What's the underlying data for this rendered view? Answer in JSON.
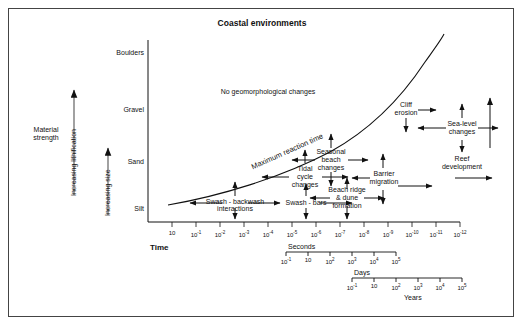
{
  "chart_data": {
    "type": "scatter",
    "title": "Coastal environments",
    "xlabel": "Time",
    "ylabel": "Increasing size",
    "grid": false,
    "legend_position": "none",
    "y_categories": [
      "Boulders",
      "Gravel",
      "Sand",
      "Silt"
    ],
    "x_tick_labels": [
      "10",
      "10-1",
      "10-2",
      "10-3",
      "10-4",
      "10-5",
      "10-6",
      "10-7",
      "10-8",
      "10-9",
      "10-10",
      "10-11",
      "10-12"
    ],
    "x_tick_exponents": [
      "",
      "-1",
      "-2",
      "-3",
      "-4",
      "-5",
      "-6",
      "-7",
      "-8",
      "-9",
      "-10",
      "-11",
      "-12"
    ],
    "secondary_axes": [
      {
        "name": "Seconds",
        "ticks": [
          "-1",
          "",
          "2",
          "3",
          "4",
          "5"
        ],
        "base": "10"
      },
      {
        "name": "Days",
        "ticks": [
          "-1",
          "",
          "2",
          "3",
          "4",
          "5"
        ],
        "base": "10"
      },
      {
        "name": "Years",
        "ticks": [
          "-1",
          "",
          "2",
          "3",
          "4",
          "5"
        ],
        "base": "10"
      }
    ],
    "curve_annotation": "Maximum reaction time",
    "region_annotation": "No geomorphological changes",
    "processes": [
      "Swash - backwash interactions",
      "Swash - bars",
      "Tidal cycle changes",
      "Seasonal beach changes",
      "Beach ridge & dune formation",
      "Barrier migration",
      "Cliff erosion",
      "Sea-level changes",
      "Reef development"
    ]
  },
  "figure": {
    "title": "Coastal environments",
    "no_change_region": "No geomorphological changes",
    "curve_label": "Maximum reaction time",
    "time_axis_label": "Time",
    "y_axis_vertical_label": "Increasing size",
    "material_strength_label_line1": "Material",
    "material_strength_label_line2": "strength",
    "lithification_label": "Increasing lithification",
    "size_classes": {
      "boulders": "Boulders",
      "gravel": "Gravel",
      "sand": "Sand",
      "silt": "Silt"
    },
    "processes": {
      "swash_backwash_l1": "Swash - backwash",
      "swash_backwash_l2": "interactions",
      "swash_bars": "Swash - bars",
      "tidal_l1": "Tidal",
      "tidal_l2": "cycle",
      "tidal_l3": "changes",
      "seasonal_l1": "Seasonal",
      "seasonal_l2": "beach",
      "seasonal_l3": "changes",
      "beachridge_l1": "Beach ridge",
      "beachridge_l2": "& dune",
      "beachridge_l3": "formation",
      "barrier_l1": "Barrier",
      "barrier_l2": "migration",
      "cliff_l1": "Cliff",
      "cliff_l2": "erosion",
      "sealevel_l1": "Sea-level",
      "sealevel_l2": "changes",
      "reef_l1": "Reef",
      "reef_l2": "development"
    },
    "scales": {
      "seconds": "Seconds",
      "days": "Days",
      "years": "Years"
    },
    "xticks": [
      {
        "label": "10",
        "exp": ""
      },
      {
        "label": "10",
        "exp": "-1"
      },
      {
        "label": "10",
        "exp": "-2"
      },
      {
        "label": "10",
        "exp": "-3"
      },
      {
        "label": "10",
        "exp": "-4"
      },
      {
        "label": "10",
        "exp": "-5"
      },
      {
        "label": "10",
        "exp": "-6"
      },
      {
        "label": "10",
        "exp": "-7"
      },
      {
        "label": "10",
        "exp": "-8"
      },
      {
        "label": "10",
        "exp": "-9"
      },
      {
        "label": "10",
        "exp": "-10"
      },
      {
        "label": "10",
        "exp": "-11"
      },
      {
        "label": "10",
        "exp": "-12"
      }
    ],
    "subticks": [
      {
        "label": "10",
        "exp": "-1"
      },
      {
        "label": "10",
        "exp": ""
      },
      {
        "label": "10",
        "exp": "2"
      },
      {
        "label": "10",
        "exp": "3"
      },
      {
        "label": "10",
        "exp": "4"
      },
      {
        "label": "10",
        "exp": "5"
      }
    ]
  },
  "colors": {
    "ink": "#111111",
    "frame": "#444444",
    "background": "#ffffff"
  }
}
